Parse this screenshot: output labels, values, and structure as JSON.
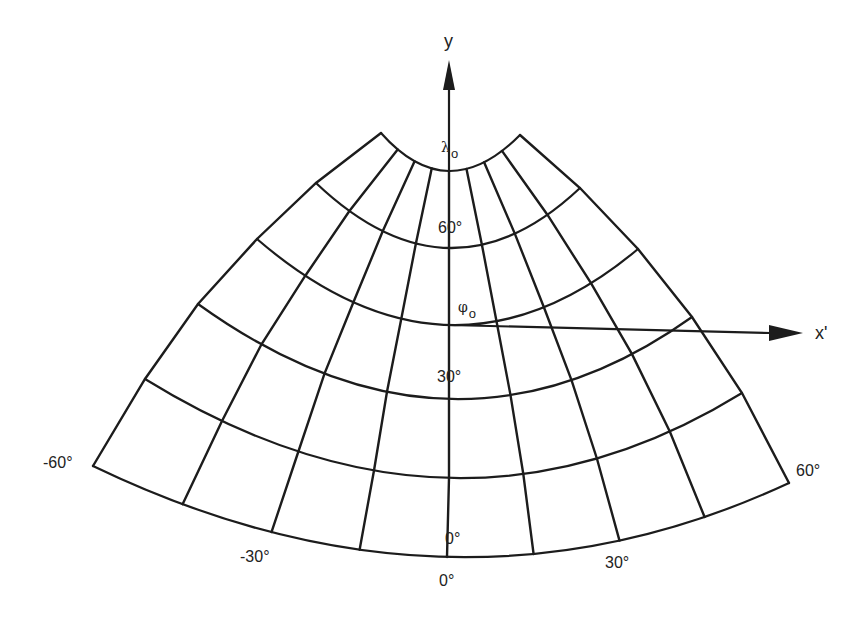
{
  "figure": {
    "line_color": "#1c1c1c",
    "background": "#ffffff"
  },
  "axes": {
    "y": {
      "label": "y",
      "origin": [
        449,
        325
      ],
      "tip": [
        449,
        60
      ]
    },
    "x": {
      "label": "x'",
      "origin": [
        449,
        325
      ],
      "tip": [
        803,
        333
      ]
    }
  },
  "annotations": {
    "central_meridian": {
      "symbol": "λ",
      "subscript": "o"
    },
    "standard_parallel": {
      "symbol": "φ",
      "subscript": "o"
    }
  },
  "parallels": [
    {
      "deg": 75,
      "left": [
        381,
        133
      ],
      "center": [
        449,
        171
      ],
      "right": [
        520,
        135
      ]
    },
    {
      "deg": 60,
      "left": [
        316,
        183
      ],
      "center": [
        449,
        248
      ],
      "right": [
        580,
        188
      ]
    },
    {
      "deg": 45,
      "left": [
        257,
        239
      ],
      "center": [
        449,
        325
      ],
      "right": [
        638,
        249
      ]
    },
    {
      "deg": 30,
      "left": [
        198,
        304
      ],
      "center": [
        449,
        399
      ],
      "right": [
        692,
        317
      ]
    },
    {
      "deg": 15,
      "left": [
        145,
        379
      ],
      "center": [
        449,
        478
      ],
      "right": [
        742,
        393
      ]
    },
    {
      "deg": 0,
      "left": [
        93,
        466
      ],
      "center": [
        447,
        557
      ],
      "right": [
        789,
        483
      ]
    }
  ],
  "meridians_deg": [
    -60,
    -45,
    -30,
    -15,
    0,
    15,
    30,
    45,
    60
  ],
  "labels": {
    "parallel_60": "60°",
    "parallel_30": "30°",
    "parallel_0_inner": "0°",
    "meridian_minus60": "-60°",
    "meridian_minus30": "-30°",
    "meridian_0": "0°",
    "meridian_30": "30°",
    "meridian_60": "60°"
  }
}
